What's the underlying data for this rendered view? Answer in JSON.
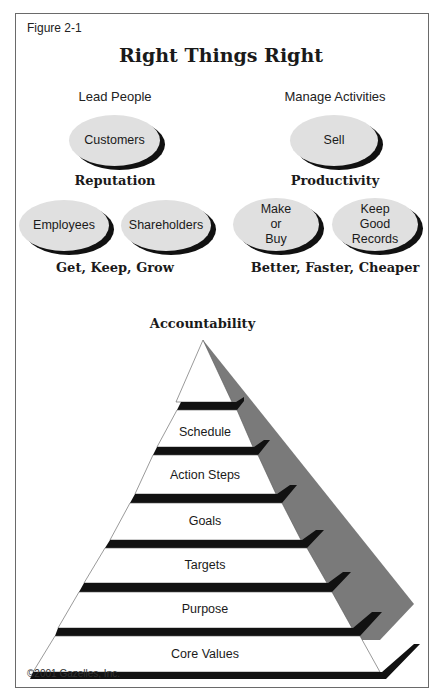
{
  "figure_label": "Figure 2-1",
  "title": "Right Things Right",
  "left_column": {
    "heading": "Lead People",
    "top_bubble": "Customers",
    "section_label": "Reputation",
    "bottom_bubbles": [
      "Employees",
      "Shareholders"
    ],
    "footer": "Get, Keep, Grow"
  },
  "right_column": {
    "heading": "Manage Activities",
    "top_bubble": "Sell",
    "section_label": "Productivity",
    "bottom_bubbles": [
      "Make\nor\nBuy",
      "Keep\nGood\nRecords"
    ],
    "footer": "Better, Faster, Cheaper"
  },
  "pyramid": {
    "title": "Accountability",
    "levels_top_to_bottom": [
      "",
      "Schedule",
      "Action Steps",
      "Goals",
      "Targets",
      "Purpose",
      "Core Values"
    ]
  },
  "copyright": "©2001 Gazelles, Inc.",
  "colors": {
    "bubble_fill": "#e0e0e0",
    "bubble_shadow": "#111111",
    "pyramid_face": "#ffffff",
    "pyramid_side": "#7a7a7a",
    "pyramid_band": "#111111",
    "frame_border": "#6a6a6a"
  }
}
